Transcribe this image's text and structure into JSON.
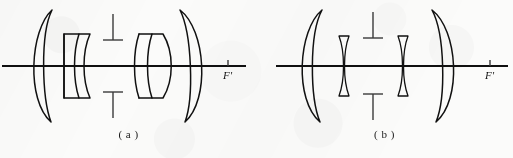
{
  "figure": {
    "background_color": "#fbfbfa",
    "ink_color": "#111111"
  },
  "panels": [
    {
      "id": "a",
      "caption": "( a )",
      "axis_label": "F'",
      "axis_label_meaning": "rear focal point",
      "elements": [
        {
          "name": "front-meniscus-lens",
          "type": "thick-meniscus",
          "position": "left-outer"
        },
        {
          "name": "front-cemented-doublet",
          "type": "doublet",
          "position": "left-inner"
        },
        {
          "name": "aperture-stop",
          "type": "stop",
          "position": "center"
        },
        {
          "name": "rear-cemented-doublet",
          "type": "doublet",
          "position": "right-inner"
        },
        {
          "name": "rear-meniscus-lens",
          "type": "thick-meniscus",
          "position": "right-outer"
        }
      ]
    },
    {
      "id": "b",
      "caption": "( b )",
      "axis_label": "F'",
      "axis_label_meaning": "rear focal point",
      "elements": [
        {
          "name": "front-meniscus-lens",
          "type": "thick-meniscus",
          "position": "left-outer"
        },
        {
          "name": "front-negative-meniscus",
          "type": "thin-meniscus",
          "position": "left-inner"
        },
        {
          "name": "aperture-stop",
          "type": "stop",
          "position": "center"
        },
        {
          "name": "rear-negative-meniscus",
          "type": "thin-meniscus",
          "position": "right-inner"
        },
        {
          "name": "rear-meniscus-lens",
          "type": "thick-meniscus",
          "position": "right-outer"
        }
      ]
    }
  ]
}
